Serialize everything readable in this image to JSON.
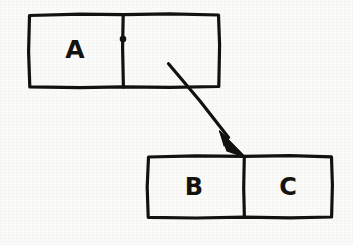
{
  "diagram": {
    "background_color": "#fbfbfa",
    "ink_color": "#141210",
    "style": "hand-drawn",
    "nodes": [
      {
        "id": "top-cell",
        "name": "top-cons-cell",
        "x": 28,
        "y": 13,
        "width": 192,
        "height": 75,
        "divider_x": 123,
        "fields": [
          {
            "slot": "car",
            "label": "A",
            "label_x": 75,
            "label_y": 51
          },
          {
            "slot": "cdr",
            "label": "",
            "label_x": 171,
            "label_y": 51
          }
        ]
      },
      {
        "id": "bottom-cell",
        "name": "bottom-cons-cell",
        "x": 147,
        "y": 155,
        "width": 186,
        "height": 63,
        "divider_x": 244,
        "fields": [
          {
            "slot": "car",
            "label": "B",
            "label_x": 194,
            "label_y": 188
          },
          {
            "slot": "cdr",
            "label": "C",
            "label_x": 288,
            "label_y": 188
          }
        ]
      }
    ],
    "pointer_dot": {
      "x": 123,
      "y": 39,
      "r": 2.6
    },
    "arrow": {
      "name": "cdr-pointer-arrow",
      "from_x": 168,
      "from_y": 64,
      "to_x": 245,
      "to_y": 157,
      "head_length": 22,
      "head_width": 15
    },
    "labels": {
      "a": "A",
      "b": "B",
      "c": "C"
    }
  }
}
